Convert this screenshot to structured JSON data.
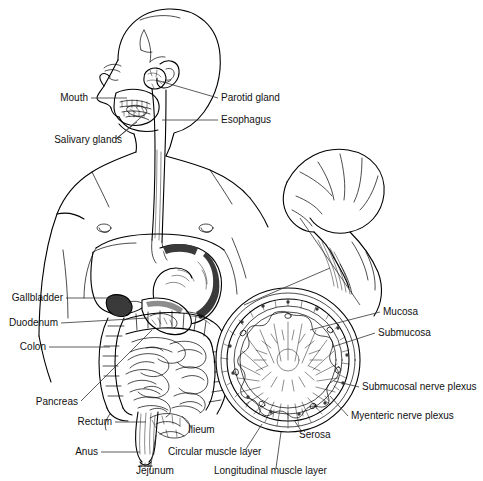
{
  "figure": {
    "background_color": "#ffffff",
    "ink_color": "#000000",
    "label_color": "#111111",
    "leader_color": "#333333",
    "width": 483,
    "height": 481
  },
  "labels": {
    "mouth": "Mouth",
    "salivary_glands": "Salivary glands",
    "parotid_gland": "Parotid gland",
    "esophagus": "Esophagus",
    "gallbladder": "Gallbladder",
    "duodenum": "Duodenum",
    "colon": "Colon",
    "pancreas": "Pancreas",
    "rectum": "Rectum",
    "anus": "Anus",
    "jejunum": "Jejunum",
    "ilieum": "Ilieum",
    "circular_muscle_layer": "Circular muscle layer",
    "longitudinal_muscle_layer": "Longitudinal muscle layer",
    "mucosa": "Mucosa",
    "submucosa": "Submucosa",
    "submucosal_nerve_plexus": "Submucosal nerve plexus",
    "myenteric_nerve_plexus": "Myenteric nerve plexus",
    "serosa": "Serosa"
  },
  "label_list": [
    {
      "key": "mouth",
      "text": "Mouth",
      "anchor": "end",
      "x": 88,
      "y": 101
    },
    {
      "key": "salivary_glands",
      "text": "Salivary glands",
      "anchor": "end",
      "x": 122,
      "y": 143
    },
    {
      "key": "parotid_gland",
      "text": "Parotid gland",
      "anchor": "start",
      "x": 221,
      "y": 101
    },
    {
      "key": "esophagus",
      "text": "Esophagus",
      "anchor": "start",
      "x": 221,
      "y": 123
    },
    {
      "key": "gallbladder",
      "text": "Gallbladder",
      "anchor": "end",
      "x": 63,
      "y": 301
    },
    {
      "key": "duodenum",
      "text": "Duodenum",
      "anchor": "end",
      "x": 58,
      "y": 326
    },
    {
      "key": "colon",
      "text": "Colon",
      "anchor": "end",
      "x": 46,
      "y": 350
    },
    {
      "key": "pancreas",
      "text": "Pancreas",
      "anchor": "end",
      "x": 78,
      "y": 405
    },
    {
      "key": "rectum",
      "text": "Rectum",
      "anchor": "end",
      "x": 112,
      "y": 425
    },
    {
      "key": "anus",
      "text": "Anus",
      "anchor": "end",
      "x": 98,
      "y": 455
    },
    {
      "key": "jejunum",
      "text": "Jejunum",
      "anchor": "start",
      "x": 136,
      "y": 474
    },
    {
      "key": "ilieum",
      "text": "Ilieum",
      "anchor": "start",
      "x": 188,
      "y": 433
    },
    {
      "key": "circular_muscle_layer",
      "text": "Circular muscle layer",
      "anchor": "start",
      "x": 168,
      "y": 455
    },
    {
      "key": "longitudinal_muscle_layer",
      "text": "Longitudinal muscle layer",
      "anchor": "start",
      "x": 214,
      "y": 474
    },
    {
      "key": "mucosa",
      "text": "Mucosa",
      "anchor": "start",
      "x": 383,
      "y": 315
    },
    {
      "key": "submucosa",
      "text": "Submucosa",
      "anchor": "start",
      "x": 378,
      "y": 336
    },
    {
      "key": "submucosal_nerve_plexus",
      "text": "Submucosal nerve plexus",
      "anchor": "start",
      "x": 362,
      "y": 390
    },
    {
      "key": "myenteric_nerve_plexus",
      "text": "Myenteric nerve plexus",
      "anchor": "start",
      "x": 351,
      "y": 419
    },
    {
      "key": "serosa",
      "text": "Serosa",
      "anchor": "start",
      "x": 299,
      "y": 438
    }
  ],
  "structures": [
    {
      "name": "head-profile",
      "description": "Male head shown in left-facing profile with cranial suture lines and ear"
    },
    {
      "name": "torso-outline",
      "description": "Upper torso, shoulders, chest and abdomen outline"
    },
    {
      "name": "oral-cavity",
      "description": "Mouth with teeth and tongue"
    },
    {
      "name": "parotid-gland",
      "description": "Parotid salivary gland anterior to the ear"
    },
    {
      "name": "esophagus-tube",
      "description": "Vertical esophageal tube from pharynx to stomach"
    },
    {
      "name": "stomach",
      "description": "Stomach with shaded greater curvature"
    },
    {
      "name": "liver-gallbladder",
      "description": "Liver margin with gallbladder below"
    },
    {
      "name": "duodenum-pancreas",
      "description": "Duodenal C-loop with pancreas"
    },
    {
      "name": "colon-frame",
      "description": "Ascending, transverse and descending colon haustra"
    },
    {
      "name": "small-intestine-coils",
      "description": "Coiled jejunum and ileum"
    },
    {
      "name": "rectum-anus",
      "description": "Rectum tapering to anal canal"
    },
    {
      "name": "enlarged-intestine-loop",
      "description": "Magnified intestinal loop with mesentery at right"
    },
    {
      "name": "cross-section-circle",
      "description": "Circular cross-section of intestinal wall showing concentric layers and radial villi"
    }
  ]
}
